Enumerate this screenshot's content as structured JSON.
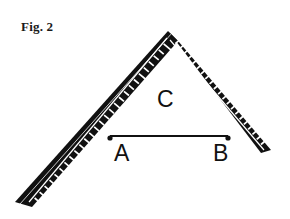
{
  "figure": {
    "caption": "Fig. 2",
    "background_color": "#ffffff",
    "ink_color": "#111111",
    "highlight_color": "#ffffff"
  },
  "labels": {
    "apex": "C",
    "left_point": "A",
    "right_point": "B"
  },
  "tool": {
    "name": "carpenters-square",
    "body_color": "#111111",
    "outline_color": "#ffffff",
    "tick_color": "#ffffff",
    "apex_mark": "x-cross",
    "left_arm_ticks": 26,
    "right_arm_ticks": 20
  },
  "geometry": {
    "apex_outer": [
      168,
      30
    ],
    "apex_inner": [
      168,
      72
    ],
    "left_tip_outer": [
      20,
      206
    ],
    "right_tip_outer": [
      274,
      141
    ],
    "chord_start": [
      110,
      136
    ],
    "chord_end": [
      228,
      136
    ],
    "chord_width": 2
  }
}
